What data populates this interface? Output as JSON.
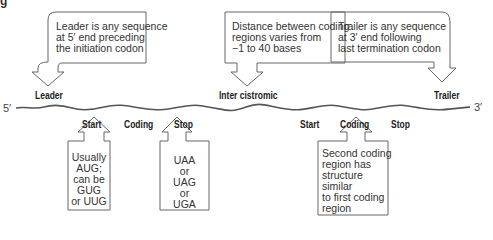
{
  "figure": {
    "title_fragment": "g",
    "strand": {
      "five_prime": "5′",
      "three_prime": "3′",
      "color": "#555555"
    },
    "callouts_top": [
      {
        "id": "leader",
        "text": "Leader is any sequence\nat 5′ end preceding\nthe initiation codon",
        "label": "Leader"
      },
      {
        "id": "intercistronic",
        "text": "Distance between coding\nregions varies from\n−1 to 40 bases",
        "label": "Inter cistromic"
      },
      {
        "id": "trailer",
        "text": "Trailer is any sequence\nat 3′ end following\nlast termination codon",
        "label": "Trailer"
      }
    ],
    "region_labels_1": {
      "start": "Start",
      "coding": "Coding",
      "stop": "Stop"
    },
    "region_labels_2": {
      "start": "Start",
      "coding": "Coding",
      "stop": "Stop"
    },
    "callouts_bottom": [
      {
        "id": "start-codons",
        "text": "Usually\nAUG;\ncan be\nGUG\nor UUG"
      },
      {
        "id": "stop-codons",
        "text": "UAA\nor\nUAG\nor\nUGA"
      },
      {
        "id": "second-coding",
        "text": "Second coding\nregion has\nstructure\nsimilar\nto first coding\nregion"
      }
    ]
  }
}
